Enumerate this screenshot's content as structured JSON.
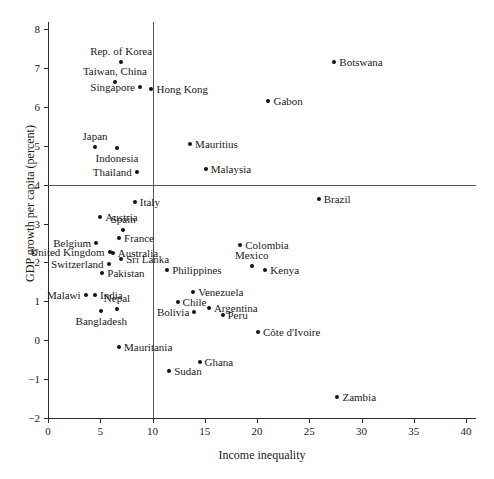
{
  "chart_data": {
    "type": "scatter",
    "title": "",
    "xlabel": "Income inequality",
    "ylabel": "GDP growth per capita (percent)",
    "xlim": [
      0,
      41
    ],
    "ylim": [
      -2,
      8.4
    ],
    "grid": false,
    "legend": "none",
    "xticks": [
      0,
      5,
      10,
      15,
      20,
      25,
      30,
      35,
      40
    ],
    "xtick_labels": [
      "0",
      "5",
      "10",
      "15",
      "20",
      "25",
      "30",
      "35",
      "40"
    ],
    "yticks": [
      -2,
      -1,
      0,
      1,
      2,
      3,
      4,
      5,
      6,
      7,
      8
    ],
    "ytick_labels": [
      "−2",
      "−1",
      "0",
      "1",
      "2",
      "3",
      "4",
      "5",
      "6",
      "7",
      "8"
    ],
    "reference_lines": [
      {
        "orientation": "vertical",
        "value": 10
      },
      {
        "orientation": "horizontal",
        "value": 4
      }
    ],
    "points": [
      {
        "label": "Rep. of Korea",
        "x": 7.0,
        "y": 7.15,
        "label_pos": "above"
      },
      {
        "label": "Taiwan, China",
        "x": 6.4,
        "y": 6.65,
        "label_pos": "above"
      },
      {
        "label": "Singapore",
        "x": 8.8,
        "y": 6.5,
        "label_pos": "left"
      },
      {
        "label": "Hong Kong",
        "x": 9.9,
        "y": 6.45,
        "label_pos": "right"
      },
      {
        "label": "Botswana",
        "x": 27.4,
        "y": 7.14,
        "label_pos": "right"
      },
      {
        "label": "Gabon",
        "x": 21.1,
        "y": 6.15,
        "label_pos": "right"
      },
      {
        "label": "Japan",
        "x": 4.5,
        "y": 4.97,
        "label_pos": "above"
      },
      {
        "label": "Indonesia",
        "x": 6.6,
        "y": 4.93,
        "label_pos": "below"
      },
      {
        "label": "Mauritius",
        "x": 13.6,
        "y": 5.05,
        "label_pos": "right"
      },
      {
        "label": "Thailand",
        "x": 8.5,
        "y": 4.33,
        "label_pos": "left"
      },
      {
        "label": "Malaysia",
        "x": 15.1,
        "y": 4.4,
        "label_pos": "right"
      },
      {
        "label": "Brazil",
        "x": 25.9,
        "y": 3.62,
        "label_pos": "right"
      },
      {
        "label": "Italy",
        "x": 8.3,
        "y": 3.55,
        "label_pos": "right"
      },
      {
        "label": "Austria",
        "x": 5.0,
        "y": 3.17,
        "label_pos": "right"
      },
      {
        "label": "Spain",
        "x": 7.2,
        "y": 2.83,
        "label_pos": "above"
      },
      {
        "label": "France",
        "x": 6.8,
        "y": 2.62,
        "label_pos": "right"
      },
      {
        "label": "Belgium",
        "x": 4.6,
        "y": 2.5,
        "label_pos": "left"
      },
      {
        "label": "Colombia",
        "x": 18.4,
        "y": 2.44,
        "label_pos": "right"
      },
      {
        "label": "Australia",
        "x": 6.2,
        "y": 2.24,
        "label_pos": "right"
      },
      {
        "label": "United Kingdom",
        "x": 5.9,
        "y": 2.26,
        "label_pos": "left"
      },
      {
        "label": "Sri Lanka",
        "x": 7.0,
        "y": 2.1,
        "label_pos": "right"
      },
      {
        "label": "Mexico",
        "x": 19.5,
        "y": 1.9,
        "label_pos": "above"
      },
      {
        "label": "Switzerland",
        "x": 5.8,
        "y": 1.97,
        "label_pos": "left"
      },
      {
        "label": "Kenya",
        "x": 20.8,
        "y": 1.8,
        "label_pos": "right"
      },
      {
        "label": "Philippines",
        "x": 11.4,
        "y": 1.8,
        "label_pos": "right"
      },
      {
        "label": "Pakistan",
        "x": 5.2,
        "y": 1.74,
        "label_pos": "right"
      },
      {
        "label": "Venezuela",
        "x": 13.9,
        "y": 1.23,
        "label_pos": "right"
      },
      {
        "label": "India",
        "x": 4.5,
        "y": 1.16,
        "label_pos": "right"
      },
      {
        "label": "Malawi",
        "x": 3.6,
        "y": 1.15,
        "label_pos": "left"
      },
      {
        "label": "Chile",
        "x": 12.4,
        "y": 0.98,
        "label_pos": "right"
      },
      {
        "label": "Argentina",
        "x": 15.4,
        "y": 0.82,
        "label_pos": "right"
      },
      {
        "label": "Nepal",
        "x": 6.6,
        "y": 0.8,
        "label_pos": "above"
      },
      {
        "label": "Bolivia",
        "x": 14.0,
        "y": 0.72,
        "label_pos": "left"
      },
      {
        "label": "Peru",
        "x": 16.7,
        "y": 0.65,
        "label_pos": "right"
      },
      {
        "label": "Bangladesh",
        "x": 5.1,
        "y": 0.75,
        "label_pos": "below"
      },
      {
        "label": "Côte d'Ivoire",
        "x": 20.1,
        "y": 0.2,
        "label_pos": "right"
      },
      {
        "label": "Mauritania",
        "x": 6.8,
        "y": -0.18,
        "label_pos": "right"
      },
      {
        "label": "Ghana",
        "x": 14.5,
        "y": -0.55,
        "label_pos": "right"
      },
      {
        "label": "Sudan",
        "x": 11.6,
        "y": -0.78,
        "label_pos": "right"
      },
      {
        "label": "Zambia",
        "x": 27.7,
        "y": -1.45,
        "label_pos": "right"
      }
    ]
  }
}
